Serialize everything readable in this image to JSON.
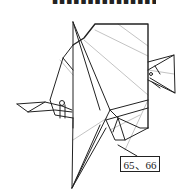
{
  "header": {
    "cutoff_text": "▪▪▪▪▪▪▪▪▪▪▪▪▪▪▪▪"
  },
  "figure": {
    "type": "origami-diagram",
    "stroke_color": "#222222",
    "fold_line_color": "#9a9a9a"
  },
  "label": {
    "text": "65、66"
  }
}
